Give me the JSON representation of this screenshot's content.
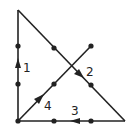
{
  "diagram": {
    "colors": {
      "line": "#222222",
      "background": "#ffffff"
    },
    "vertices": {
      "top": [
        18,
        10
      ],
      "bottom_left": [
        18,
        121
      ],
      "bottom_right": [
        125,
        121
      ],
      "diag_end": [
        91,
        46
      ]
    },
    "dots": [
      [
        18,
        46
      ],
      [
        18,
        84
      ],
      [
        54,
        48
      ],
      [
        91,
        85
      ],
      [
        91,
        46
      ],
      [
        54,
        84
      ],
      [
        18,
        121
      ],
      [
        54,
        121
      ],
      [
        91,
        121
      ]
    ],
    "paths": [
      {
        "id": "1",
        "label": "1",
        "from": [
          18,
          121
        ],
        "to": [
          18,
          10
        ],
        "arrow_at": [
          18,
          64
        ],
        "arrow_dir": "up",
        "label_pos": [
          23,
          71
        ]
      },
      {
        "id": "2",
        "label": "2",
        "from": [
          18,
          10
        ],
        "to": [
          125,
          121
        ],
        "arrow_at": [
          81,
          75
        ],
        "arrow_dir": "down-right",
        "label_pos": [
          87,
          75
        ]
      },
      {
        "id": "3",
        "label": "3",
        "from": [
          125,
          121
        ],
        "to": [
          18,
          121
        ],
        "arrow_at": [
          74,
          121
        ],
        "arrow_dir": "left",
        "label_pos": [
          72,
          114
        ]
      },
      {
        "id": "4",
        "label": "4",
        "from": [
          18,
          121
        ],
        "to": [
          91,
          46
        ],
        "arrow_at": [
          40,
          99
        ],
        "arrow_dir": "up-right",
        "label_pos": [
          44,
          109
        ]
      }
    ]
  }
}
